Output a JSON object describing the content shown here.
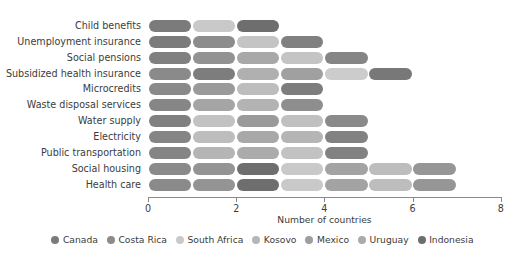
{
  "chart_data": {
    "type": "bar",
    "orientation": "horizontal",
    "stacked": true,
    "title": "",
    "xlabel": "Number of countries",
    "ylabel": "",
    "xlim": [
      0,
      8
    ],
    "xticks": [
      0,
      2,
      4,
      6,
      8
    ],
    "grid": false,
    "legend_position": "bottom",
    "categories": [
      "Child benefits",
      "Unemployment insurance",
      "Social pensions",
      "Subsidized health insurance",
      "Microcredits",
      "Waste disposal services",
      "Water supply",
      "Electricity",
      "Public transportation",
      "Social housing",
      "Health care"
    ],
    "series": [
      {
        "name": "Canada",
        "color": "#7b7b7b",
        "values": [
          1,
          1,
          1,
          1,
          1,
          1,
          1,
          1,
          1,
          1,
          1
        ]
      },
      {
        "name": "Costa Rica",
        "color": "#8c8c8c",
        "values": [
          0,
          1,
          1,
          1,
          1,
          1,
          0,
          0,
          1,
          1,
          1
        ]
      },
      {
        "name": "South Africa",
        "color": "#c9c9c9",
        "values": [
          1,
          1,
          1,
          0,
          1,
          1,
          1,
          1,
          0,
          0,
          0
        ]
      },
      {
        "name": "Kosovo",
        "color": "#b5b5b5",
        "values": [
          0,
          1,
          1,
          1,
          0,
          0,
          1,
          1,
          1,
          1,
          1
        ]
      },
      {
        "name": "Mexico",
        "color": "#9e9e9e",
        "values": [
          0,
          0,
          1,
          1,
          1,
          1,
          1,
          1,
          1,
          1,
          1
        ]
      },
      {
        "name": "Uruguay",
        "color": "#aaaaaa",
        "values": [
          0,
          0,
          0,
          1,
          0,
          0,
          0,
          0,
          0,
          1,
          1
        ]
      },
      {
        "name": "Indonesia",
        "color": "#6e6e6e",
        "values": [
          1,
          0,
          1,
          1,
          0,
          0,
          1,
          1,
          1,
          2,
          2
        ]
      }
    ],
    "totals": [
      3,
      4,
      5,
      6,
      4,
      4,
      5,
      5,
      5,
      7,
      7
    ],
    "rows": [
      {
        "category": "Child benefits",
        "total": 3,
        "segments": [
          {
            "series": "Canada",
            "start": 0,
            "length": 1,
            "color": "#7b7b7b"
          },
          {
            "series": "South Africa",
            "start": 1,
            "length": 1,
            "color": "#c9c9c9"
          },
          {
            "series": "Indonesia",
            "start": 2,
            "length": 1,
            "color": "#6e6e6e"
          }
        ]
      },
      {
        "category": "Unemployment insurance",
        "total": 4,
        "segments": [
          {
            "series": "Canada",
            "start": 0,
            "length": 1,
            "color": "#7b7b7b"
          },
          {
            "series": "Costa Rica",
            "start": 1,
            "length": 1,
            "color": "#8c8c8c"
          },
          {
            "series": "South Africa",
            "start": 2,
            "length": 1,
            "color": "#c4c4c4"
          },
          {
            "series": "Kosovo",
            "start": 3,
            "length": 1,
            "color": "#808080"
          }
        ]
      },
      {
        "category": "Social pensions",
        "total": 5,
        "segments": [
          {
            "series": "Canada",
            "start": 0,
            "length": 1,
            "color": "#808080"
          },
          {
            "series": "Costa Rica",
            "start": 1,
            "length": 1,
            "color": "#929292"
          },
          {
            "series": "South Africa",
            "start": 2,
            "length": 1,
            "color": "#a8a8a8"
          },
          {
            "series": "Kosovo",
            "start": 3,
            "length": 1,
            "color": "#c4c4c4"
          },
          {
            "series": "Indonesia",
            "start": 4,
            "length": 1,
            "color": "#858585"
          }
        ]
      },
      {
        "category": "Subsidized health insurance",
        "total": 6,
        "segments": [
          {
            "series": "Canada",
            "start": 0,
            "length": 1,
            "color": "#8a8a8a"
          },
          {
            "series": "Costa Rica",
            "start": 1,
            "length": 1,
            "color": "#7d7d7d"
          },
          {
            "series": "Mexico",
            "start": 2,
            "length": 1,
            "color": "#b0b0b0"
          },
          {
            "series": "Kosovo",
            "start": 3,
            "length": 1,
            "color": "#a0a0a0"
          },
          {
            "series": "Uruguay",
            "start": 4,
            "length": 1,
            "color": "#cccccc"
          },
          {
            "series": "Indonesia",
            "start": 5,
            "length": 1,
            "color": "#787878"
          }
        ]
      },
      {
        "category": "Microcredits",
        "total": 4,
        "segments": [
          {
            "series": "Canada",
            "start": 0,
            "length": 1,
            "color": "#8a8a8a"
          },
          {
            "series": "Costa Rica",
            "start": 1,
            "length": 1,
            "color": "#9a9a9a"
          },
          {
            "series": "South Africa",
            "start": 2,
            "length": 1,
            "color": "#bdbdbd"
          },
          {
            "series": "Mexico",
            "start": 3,
            "length": 1,
            "color": "#7d7d7d"
          }
        ]
      },
      {
        "category": "Waste disposal services",
        "total": 4,
        "segments": [
          {
            "series": "Canada",
            "start": 0,
            "length": 1,
            "color": "#868686"
          },
          {
            "series": "Costa Rica",
            "start": 1,
            "length": 1,
            "color": "#a5a5a5"
          },
          {
            "series": "South Africa",
            "start": 2,
            "length": 1,
            "color": "#b3b3b3"
          },
          {
            "series": "Mexico",
            "start": 3,
            "length": 1,
            "color": "#8e8e8e"
          }
        ]
      },
      {
        "category": "Water supply",
        "total": 5,
        "segments": [
          {
            "series": "Canada",
            "start": 0,
            "length": 1,
            "color": "#808080"
          },
          {
            "series": "South Africa",
            "start": 1,
            "length": 1,
            "color": "#c2c2c2"
          },
          {
            "series": "Mexico",
            "start": 2,
            "length": 1,
            "color": "#9a9a9a"
          },
          {
            "series": "Kosovo",
            "start": 3,
            "length": 1,
            "color": "#c0c0c0"
          },
          {
            "series": "Indonesia",
            "start": 4,
            "length": 1,
            "color": "#8a8a8a"
          }
        ]
      },
      {
        "category": "Electricity",
        "total": 5,
        "segments": [
          {
            "series": "Canada",
            "start": 0,
            "length": 1,
            "color": "#858585"
          },
          {
            "series": "South Africa",
            "start": 1,
            "length": 1,
            "color": "#bdbdbd"
          },
          {
            "series": "Mexico",
            "start": 2,
            "length": 1,
            "color": "#a8a8a8"
          },
          {
            "series": "Kosovo",
            "start": 3,
            "length": 1,
            "color": "#b5b5b5"
          },
          {
            "series": "Indonesia",
            "start": 4,
            "length": 1,
            "color": "#828282"
          }
        ]
      },
      {
        "category": "Public transportation",
        "total": 5,
        "segments": [
          {
            "series": "Canada",
            "start": 0,
            "length": 1,
            "color": "#858585"
          },
          {
            "series": "Costa Rica",
            "start": 1,
            "length": 1,
            "color": "#b5b5b5"
          },
          {
            "series": "Mexico",
            "start": 2,
            "length": 1,
            "color": "#ababab"
          },
          {
            "series": "Kosovo",
            "start": 3,
            "length": 1,
            "color": "#c2c2c2"
          },
          {
            "series": "Indonesia",
            "start": 4,
            "length": 1,
            "color": "#828282"
          }
        ]
      },
      {
        "category": "Social housing",
        "total": 7,
        "segments": [
          {
            "series": "Canada",
            "start": 0,
            "length": 1,
            "color": "#8a8a8a"
          },
          {
            "series": "Costa Rica",
            "start": 1,
            "length": 1,
            "color": "#949494"
          },
          {
            "series": "Indonesia",
            "start": 2,
            "length": 1,
            "color": "#6e6e6e"
          },
          {
            "series": "South Africa",
            "start": 3,
            "length": 1,
            "color": "#c9c9c9"
          },
          {
            "series": "Mexico",
            "start": 4,
            "length": 1,
            "color": "#a3a3a3"
          },
          {
            "series": "Uruguay",
            "start": 5,
            "length": 1,
            "color": "#bdbdbd"
          },
          {
            "series": "Kosovo",
            "start": 6,
            "length": 1,
            "color": "#969696"
          }
        ]
      },
      {
        "category": "Health care",
        "total": 7,
        "segments": [
          {
            "series": "Canada",
            "start": 0,
            "length": 1,
            "color": "#8a8a8a"
          },
          {
            "series": "Costa Rica",
            "start": 1,
            "length": 1,
            "color": "#949494"
          },
          {
            "series": "Indonesia",
            "start": 2,
            "length": 1,
            "color": "#6e6e6e"
          },
          {
            "series": "South Africa",
            "start": 3,
            "length": 1,
            "color": "#c9c9c9"
          },
          {
            "series": "Mexico",
            "start": 4,
            "length": 1,
            "color": "#a3a3a3"
          },
          {
            "series": "Uruguay",
            "start": 5,
            "length": 1,
            "color": "#bdbdbd"
          },
          {
            "series": "Kosovo",
            "start": 6,
            "length": 1,
            "color": "#969696"
          }
        ]
      }
    ],
    "legend": [
      {
        "label": "Canada",
        "color": "#7b7b7b"
      },
      {
        "label": "Costa Rica",
        "color": "#8c8c8c"
      },
      {
        "label": "South Africa",
        "color": "#c9c9c9"
      },
      {
        "label": "Kosovo",
        "color": "#b5b5b5"
      },
      {
        "label": "Mexico",
        "color": "#9e9e9e"
      },
      {
        "label": "Uruguay",
        "color": "#aaaaaa"
      },
      {
        "label": "Indonesia",
        "color": "#6e6e6e"
      }
    ]
  },
  "axis": {
    "tick_labels": [
      "0",
      "2",
      "4",
      "6",
      "8"
    ],
    "x_title": "Number of countries"
  },
  "title": {
    "text": ""
  },
  "colors": {
    "axis": "#8a8a8a",
    "text": "#3c3c3c",
    "background": "#ffffff"
  }
}
